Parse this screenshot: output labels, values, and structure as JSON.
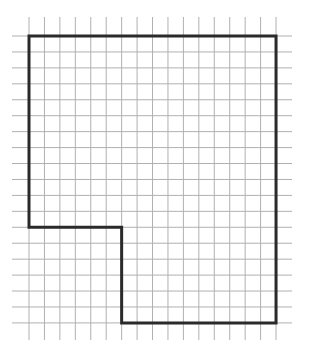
{
  "diagram": {
    "type": "grid-polygon",
    "grid": {
      "columns": 16,
      "rows": 18,
      "origin_px": [
        29,
        36
      ],
      "cell_w_px": 15.44,
      "cell_h_px": 15.94,
      "h_line_extent_px": [
        12,
        292
      ],
      "v_line_extent_px": [
        17,
        340
      ],
      "line_color": "#b0b0b0"
    },
    "shape": {
      "vertices_grid_units": [
        [
          0,
          0
        ],
        [
          16,
          0
        ],
        [
          16,
          18
        ],
        [
          6,
          18
        ],
        [
          6,
          12
        ],
        [
          0,
          12
        ]
      ],
      "stroke_color": "#2a2a2a",
      "stroke_width": 3
    }
  }
}
